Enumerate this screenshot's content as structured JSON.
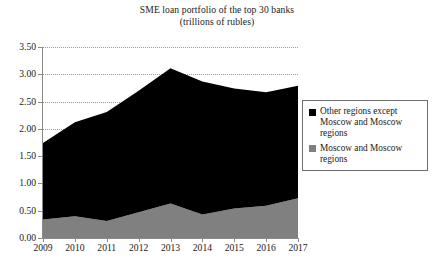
{
  "chart_data": {
    "type": "area",
    "stacked": true,
    "title": "SME loan portfolio of the top 30 banks",
    "subtitle": "(trillions of rubles)",
    "xlabel": "",
    "ylabel": "",
    "categories": [
      "2009",
      "2010",
      "2011",
      "2012",
      "2013",
      "2014",
      "2015",
      "2016",
      "2017"
    ],
    "x": [
      2009,
      2010,
      2011,
      2012,
      2013,
      2014,
      2015,
      2016,
      2017
    ],
    "series": [
      {
        "name": "Moscow and Moscow regions",
        "color": "#808080",
        "values": [
          0.34,
          0.4,
          0.31,
          0.47,
          0.63,
          0.43,
          0.54,
          0.59,
          0.73
        ]
      },
      {
        "name": "Other regions except Moscow and Moscow regions",
        "color": "#000000",
        "values": [
          1.4,
          1.72,
          2.0,
          2.23,
          2.48,
          2.44,
          2.2,
          2.08,
          2.06
        ]
      }
    ],
    "totals": [
      1.74,
      2.12,
      2.31,
      2.7,
      3.11,
      2.87,
      2.74,
      2.67,
      2.79
    ],
    "ylim": [
      0.0,
      3.5
    ],
    "ytick_values": [
      0.0,
      0.5,
      1.0,
      1.5,
      2.0,
      2.5,
      3.0,
      3.5
    ],
    "ytick_labels": [
      "0.00",
      "0.50",
      "1.00",
      "1.50",
      "2.00",
      "2.50",
      "3.00",
      "3.50"
    ],
    "grid": "horizontal-dotted",
    "legend_position": "right",
    "legend": [
      {
        "label_lines": [
          "Other regions except",
          "Moscow and Moscow",
          "regions"
        ],
        "color": "#000000"
      },
      {
        "label_lines": [
          "Moscow and Moscow",
          "regions"
        ],
        "color": "#808080"
      }
    ]
  }
}
